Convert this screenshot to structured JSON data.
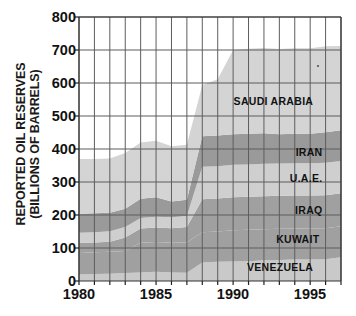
{
  "chart_data": {
    "type": "area",
    "stacked": true,
    "title": "",
    "xlabel": "",
    "ylabel": "REPORTED OIL RESERVES\n(BILLIONS OF BARRELS)",
    "xlim": [
      1980,
      1997
    ],
    "ylim": [
      0,
      800
    ],
    "ytick_values": [
      0,
      100,
      200,
      300,
      400,
      500,
      600,
      700,
      800
    ],
    "ytick_labels": [
      "0",
      "100",
      "200",
      "300",
      "400",
      "500",
      "600",
      "700",
      "800"
    ],
    "xtick_values": [
      1980,
      1985,
      1990,
      1995
    ],
    "xtick_labels": [
      "1980",
      "1985",
      "1990",
      "1995"
    ],
    "xtick_minor_values": [
      1981,
      1982,
      1983,
      1984,
      1986,
      1987,
      1988,
      1989,
      1991,
      1992,
      1993,
      1994,
      1996,
      1997
    ],
    "grid": true,
    "grid_color": "#5d5d5d",
    "x": [
      1980,
      1981,
      1982,
      1983,
      1984,
      1985,
      1986,
      1987,
      1988,
      1989,
      1990,
      1991,
      1992,
      1993,
      1994,
      1995,
      1996,
      1997
    ],
    "series": [
      {
        "name": "VENEZUELA",
        "color": "#c9c9c9",
        "values": [
          20,
          21,
          22,
          24,
          26,
          28,
          26,
          25,
          56,
          58,
          59,
          60,
          63,
          64,
          65,
          65,
          66,
          72
        ]
      },
      {
        "name": "KUWAIT",
        "color": "#a0a0a0",
        "values": [
          65,
          66,
          67,
          67,
          90,
          90,
          90,
          92,
          92,
          92,
          95,
          95,
          94,
          94,
          94,
          94,
          94,
          94
        ]
      },
      {
        "name": "IRAQ",
        "color": "#a0a0a0",
        "values": [
          31,
          30,
          30,
          41,
          43,
          44,
          44,
          47,
          100,
          100,
          100,
          100,
          100,
          100,
          100,
          100,
          100,
          100
        ]
      },
      {
        "name": "U.A.E.",
        "color": "#cfcfcf",
        "values": [
          30,
          31,
          32,
          32,
          32,
          33,
          33,
          33,
          98,
          98,
          98,
          98,
          98,
          98,
          98,
          98,
          98,
          98
        ]
      },
      {
        "name": "IRAN",
        "color": "#9a9a9a",
        "values": [
          58,
          57,
          56,
          55,
          58,
          59,
          48,
          49,
          93,
          93,
          93,
          93,
          93,
          89,
          89,
          89,
          93,
          93
        ]
      },
      {
        "name": "SAUDI ARABIA",
        "color": "#d4d4d4",
        "values": [
          166,
          165,
          164,
          169,
          171,
          171,
          167,
          167,
          155,
          170,
          255,
          258,
          258,
          258,
          259,
          259,
          260,
          255
        ]
      }
    ],
    "series_labels": [
      {
        "text": "SAUDI ARABIA",
        "x": 1995.2,
        "y": 545
      },
      {
        "text": "IRAN",
        "x": 1995.8,
        "y": 390
      },
      {
        "text": "U.A.E.",
        "x": 1995.8,
        "y": 312
      },
      {
        "text": "IRAQ",
        "x": 1995.8,
        "y": 215
      },
      {
        "text": "KUWAIT",
        "x": 1995.6,
        "y": 128
      },
      {
        "text": "VENEZUELA",
        "x": 1995.2,
        "y": 42
      }
    ]
  }
}
